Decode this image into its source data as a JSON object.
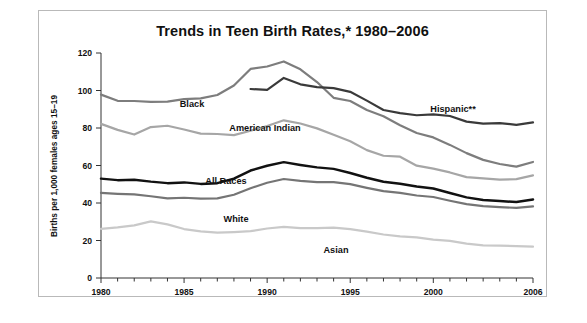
{
  "figure": {
    "title": "Trends in Teen Birth Rates,* 1980–2006",
    "border_color": "#b9b9b9",
    "background": "#ffffff"
  },
  "chart_data": {
    "type": "line",
    "title": "Trends in Teen Birth Rates,* 1980–2006",
    "xlabel": "",
    "ylabel": "Births per 1,000 females ages 15–19",
    "xlim": [
      1980,
      2006
    ],
    "ylim": [
      0,
      120
    ],
    "ytick_labels": [
      "0",
      "20",
      "40",
      "60",
      "80",
      "100",
      "120"
    ],
    "yticks": [
      0,
      20,
      40,
      60,
      80,
      100,
      120
    ],
    "xtick_labels": [
      "1980",
      "1985",
      "1990",
      "1995",
      "2000",
      "2006"
    ],
    "xticks": [
      1980,
      1985,
      1990,
      1995,
      2000,
      2006
    ],
    "minor_xticks_every": 1,
    "grid": false,
    "legend": "inline-labels",
    "x": [
      1980,
      1981,
      1982,
      1983,
      1984,
      1985,
      1986,
      1987,
      1988,
      1989,
      1990,
      1991,
      1992,
      1993,
      1994,
      1995,
      1996,
      1997,
      1998,
      1999,
      2000,
      2001,
      2002,
      2003,
      2004,
      2005,
      2006
    ],
    "series": [
      {
        "name": "Black",
        "label": "Black",
        "color": "#7d7d7d",
        "width": 2.2,
        "values": [
          97.8,
          94.5,
          94.4,
          93.9,
          94.1,
          95.4,
          95.8,
          97.6,
          102.7,
          111.5,
          112.8,
          115.5,
          111.3,
          104.5,
          96.1,
          94.4,
          89.6,
          86.3,
          81.5,
          77.3,
          75.0,
          71.0,
          66.6,
          63.0,
          60.8,
          59.4,
          61.9
        ],
        "start_year": 1980,
        "end_value": 61.9
      },
      {
        "name": "Hispanic",
        "label": "Hispanic**",
        "color": "#3a3a3a",
        "width": 2.2,
        "values": [
          null,
          null,
          null,
          null,
          null,
          null,
          null,
          null,
          null,
          100.8,
          100.3,
          106.7,
          103.3,
          101.8,
          101.3,
          99.3,
          94.6,
          89.6,
          87.9,
          86.8,
          87.3,
          86.4,
          83.4,
          82.3,
          82.6,
          81.7,
          83.0
        ],
        "start_year": 1989,
        "end_value": 83.0
      },
      {
        "name": "American Indian",
        "label": "American Indian",
        "color": "#a6a6a6",
        "width": 2.2,
        "values": [
          82.2,
          79.0,
          76.5,
          80.5,
          81.2,
          79.2,
          77.0,
          76.8,
          76.2,
          78.5,
          81.1,
          84.1,
          82.4,
          79.8,
          76.4,
          72.9,
          68.2,
          65.2,
          64.7,
          59.9,
          58.3,
          56.3,
          53.8,
          53.1,
          52.5,
          52.7,
          54.7
        ],
        "start_year": 1980,
        "end_value": 54.7
      },
      {
        "name": "All Races",
        "label": "All Races",
        "color": "#111111",
        "width": 2.5,
        "values": [
          53.0,
          52.2,
          52.4,
          51.4,
          50.6,
          51.0,
          50.2,
          50.6,
          53.0,
          57.3,
          59.9,
          61.8,
          60.3,
          59.0,
          58.2,
          56.0,
          53.5,
          51.3,
          50.3,
          48.8,
          47.7,
          45.3,
          43.0,
          41.6,
          41.1,
          40.5,
          41.9
        ],
        "start_year": 1980,
        "end_value": 41.9
      },
      {
        "name": "White",
        "label": "White",
        "color": "#757575",
        "width": 2.2,
        "values": [
          45.4,
          44.9,
          44.6,
          43.6,
          42.5,
          42.8,
          42.3,
          42.5,
          44.4,
          47.9,
          50.8,
          52.8,
          51.8,
          51.1,
          51.1,
          50.1,
          48.1,
          46.3,
          45.4,
          44.0,
          43.2,
          41.2,
          39.4,
          38.3,
          37.8,
          37.4,
          38.2
        ],
        "start_year": 1980,
        "end_value": 38.2
      },
      {
        "name": "Asian",
        "label": "Asian",
        "color": "#c9c9c9",
        "width": 2.2,
        "values": [
          26.2,
          27.0,
          28.1,
          30.2,
          28.6,
          26.1,
          24.9,
          24.2,
          24.5,
          25.0,
          26.4,
          27.3,
          26.6,
          26.6,
          26.9,
          26.1,
          24.7,
          23.2,
          22.2,
          21.7,
          20.5,
          19.8,
          18.3,
          17.4,
          17.3,
          17.0,
          16.7
        ],
        "start_year": 1980,
        "end_value": 16.7
      }
    ],
    "annotations": [
      {
        "text": "Black",
        "series": "Black",
        "x_px": 153,
        "y_px": 96
      },
      {
        "text": "American Indian",
        "series": "American Indian",
        "x_px": 226,
        "y_px": 120
      },
      {
        "text": "Hispanic**",
        "series": "Hispanic",
        "x_px": 414,
        "y_px": 101
      },
      {
        "text": "All Races",
        "series": "All Races",
        "x_px": 187,
        "y_px": 173
      },
      {
        "text": "White",
        "series": "White",
        "x_px": 197,
        "y_px": 211
      },
      {
        "text": "Asian",
        "series": "Asian",
        "x_px": 297,
        "y_px": 242
      }
    ]
  }
}
